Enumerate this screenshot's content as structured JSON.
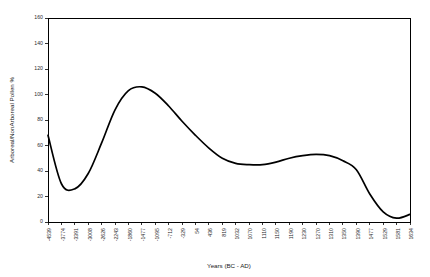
{
  "chart_data": {
    "type": "line",
    "title": "",
    "xlabel": "Years (BC - AD)",
    "ylabel": "Arboreal/NonArboreal Pollen %",
    "ylim": [
      0,
      160
    ],
    "ytick_values": [
      0,
      20,
      40,
      60,
      80,
      100,
      120,
      140,
      160
    ],
    "ytick_labels": [
      "0",
      "20",
      "40",
      "60",
      "80",
      "100",
      "120",
      "140",
      "160"
    ],
    "grid": false,
    "legend": false,
    "categories": [
      "-4539",
      "-3774",
      "-3391",
      "-3008",
      "-2626",
      "-2243",
      "-1860",
      "-1477",
      "-1095",
      "-712",
      "-329",
      "54",
      "436",
      "819",
      "1032",
      "1070",
      "1110",
      "1150",
      "1190",
      "1230",
      "1270",
      "1310",
      "1350",
      "1390",
      "1477",
      "1529",
      "1581",
      "1634"
    ],
    "series": [
      {
        "name": "Arboreal/NonArboreal Pollen %",
        "color": "#000000",
        "values": [
          68,
          30,
          26,
          38,
          62,
          88,
          103,
          106,
          101,
          91,
          79,
          68,
          58,
          50,
          46,
          45,
          45,
          47,
          50,
          52,
          53,
          52,
          48,
          41,
          22,
          8,
          3,
          6
        ]
      }
    ]
  }
}
